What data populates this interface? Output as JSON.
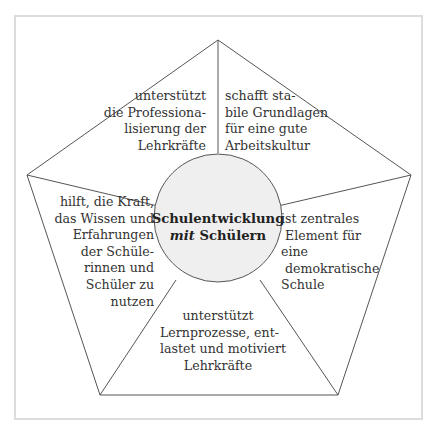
{
  "diagram": {
    "type": "pentagon-with-center-circle",
    "center": {
      "line1": "Schulentwicklung",
      "line2_italic": "mit",
      "line2_rest": " Schülern"
    },
    "segments": [
      {
        "id": "top-left",
        "text": "unterstützt\ndie Professiona-\nlisierung der\nLehrkräfte"
      },
      {
        "id": "top-right",
        "text": "schafft sta-\nbile Grundlagen\nfür eine gute\nArbeitskultur"
      },
      {
        "id": "right",
        "text": "ist zentrales\n Element für\neine\n demokratische\nSchule"
      },
      {
        "id": "bottom",
        "text": "unterstützt\nLernprozesse, ent-\nlastet und motiviert\nLehrkräfte"
      },
      {
        "id": "left",
        "text": "hilft, die Kraft,\ndas Wissen und\nErfahrungen\nder Schüle-\nrinnen und\nSchüler zu\nnutzen"
      }
    ],
    "colors": {
      "lines": "#555555",
      "circle_fill": "#efefef",
      "frame": "#dcdcdc",
      "text": "#333333"
    }
  }
}
